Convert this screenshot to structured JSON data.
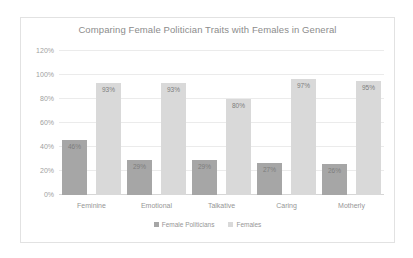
{
  "chart_data": {
    "type": "bar",
    "title": "Comparing Female Politician Traits with Females in General",
    "xlabel": "",
    "ylabel": "",
    "ylim": [
      0,
      120
    ],
    "ytick_labels": [
      "0%",
      "20%",
      "40%",
      "60%",
      "80%",
      "100%",
      "120%"
    ],
    "ytick_values": [
      0,
      20,
      40,
      60,
      80,
      100,
      120
    ],
    "grid": true,
    "legend_position": "bottom",
    "categories": [
      "Feminine",
      "Emotional",
      "Talkative",
      "Caring",
      "Motherly"
    ],
    "series": [
      {
        "name": "Female Politicians",
        "color": "#a6a6a6",
        "values": [
          46,
          29,
          29,
          27,
          26
        ],
        "labels": [
          "46%",
          "29%",
          "29%",
          "27%",
          "26%"
        ]
      },
      {
        "name": "Females",
        "color": "#d9d9d9",
        "values": [
          93,
          93,
          80,
          97,
          95
        ],
        "labels": [
          "93%",
          "93%",
          "80%",
          "97%",
          "95%"
        ]
      }
    ]
  }
}
